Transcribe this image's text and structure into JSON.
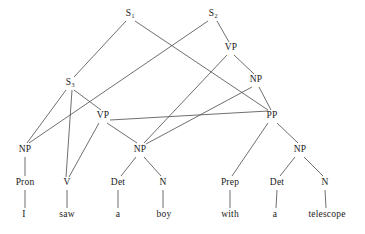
{
  "diagram": {
    "sentence": "I saw a boy with a telescope",
    "background_color": "#ffffff",
    "line_color": "#4a4a4a",
    "text_color": "#1a1a1a"
  },
  "nodes": [
    {
      "id": "S1",
      "label": "S",
      "subscript": "1",
      "kind": "category",
      "x": 130,
      "y": 14
    },
    {
      "id": "S2",
      "label": "S",
      "subscript": "2",
      "kind": "category",
      "x": 213,
      "y": 14
    },
    {
      "id": "VPhigh",
      "label": "VP",
      "subscript": "",
      "kind": "category",
      "x": 231,
      "y": 48
    },
    {
      "id": "S3",
      "label": "S",
      "subscript": "3",
      "kind": "category",
      "x": 70,
      "y": 83
    },
    {
      "id": "NPhigh",
      "label": "NP",
      "subscript": "",
      "kind": "category",
      "x": 256,
      "y": 80
    },
    {
      "id": "VPlow",
      "label": "VP",
      "subscript": "",
      "kind": "category",
      "x": 103,
      "y": 116
    },
    {
      "id": "PP",
      "label": "PP",
      "subscript": "",
      "kind": "category",
      "x": 272,
      "y": 116
    },
    {
      "id": "NPsubj",
      "label": "NP",
      "subscript": "",
      "kind": "category",
      "x": 25,
      "y": 150
    },
    {
      "id": "NPobj",
      "label": "NP",
      "subscript": "",
      "kind": "category",
      "x": 140,
      "y": 150
    },
    {
      "id": "NPpp",
      "label": "NP",
      "subscript": "",
      "kind": "category",
      "x": 300,
      "y": 150
    },
    {
      "id": "Pron",
      "label": "Pron",
      "subscript": "",
      "kind": "pos",
      "x": 25,
      "y": 183
    },
    {
      "id": "V",
      "label": "V",
      "subscript": "",
      "kind": "pos",
      "x": 67,
      "y": 183
    },
    {
      "id": "Det1",
      "label": "Det",
      "subscript": "",
      "kind": "pos",
      "x": 118,
      "y": 183
    },
    {
      "id": "N1",
      "label": "N",
      "subscript": "",
      "kind": "pos",
      "x": 163,
      "y": 183
    },
    {
      "id": "Prep",
      "label": "Prep",
      "subscript": "",
      "kind": "pos",
      "x": 230,
      "y": 183
    },
    {
      "id": "Det2",
      "label": "Det",
      "subscript": "",
      "kind": "pos",
      "x": 277,
      "y": 183
    },
    {
      "id": "N2",
      "label": "N",
      "subscript": "",
      "kind": "pos",
      "x": 325,
      "y": 183
    },
    {
      "id": "w_I",
      "label": "I",
      "subscript": "",
      "kind": "word",
      "x": 24,
      "y": 215
    },
    {
      "id": "w_saw",
      "label": "saw",
      "subscript": "",
      "kind": "word",
      "x": 67,
      "y": 215
    },
    {
      "id": "w_a1",
      "label": "a",
      "subscript": "",
      "kind": "word",
      "x": 118,
      "y": 215
    },
    {
      "id": "w_boy",
      "label": "boy",
      "subscript": "",
      "kind": "word",
      "x": 164,
      "y": 215
    },
    {
      "id": "w_with",
      "label": "with",
      "subscript": "",
      "kind": "word",
      "x": 230,
      "y": 215
    },
    {
      "id": "w_a2",
      "label": "a",
      "subscript": "",
      "kind": "word",
      "x": 275,
      "y": 215
    },
    {
      "id": "w_tel",
      "label": "telescope",
      "subscript": "",
      "kind": "word",
      "x": 327,
      "y": 215
    }
  ],
  "edges": [
    {
      "from": "S1",
      "to": "S3",
      "x1": 126,
      "y1": 21,
      "x2": 74,
      "y2": 77
    },
    {
      "from": "S1",
      "to": "PP",
      "x1": 135,
      "y1": 21,
      "x2": 268,
      "y2": 110
    },
    {
      "from": "S2",
      "to": "NPsubj",
      "x1": 208,
      "y1": 21,
      "x2": 29,
      "y2": 143
    },
    {
      "from": "S2",
      "to": "VPhigh",
      "x1": 217,
      "y1": 21,
      "x2": 229,
      "y2": 42
    },
    {
      "from": "VPhigh",
      "to": "NPobj",
      "x1": 227,
      "y1": 55,
      "x2": 144,
      "y2": 143
    },
    {
      "from": "VPhigh",
      "to": "NPhigh",
      "x1": 234,
      "y1": 55,
      "x2": 254,
      "y2": 74
    },
    {
      "from": "NPhigh",
      "to": "NPobj",
      "x1": 252,
      "y1": 87,
      "x2": 146,
      "y2": 144
    },
    {
      "from": "NPhigh",
      "to": "PP",
      "x1": 259,
      "y1": 87,
      "x2": 271,
      "y2": 110
    },
    {
      "from": "S3",
      "to": "NPsubj",
      "x1": 66,
      "y1": 90,
      "x2": 27,
      "y2": 143
    },
    {
      "from": "S3",
      "to": "VPlow",
      "x1": 74,
      "y1": 90,
      "x2": 101,
      "y2": 110
    },
    {
      "from": "VPlow",
      "to": "V",
      "x1": 99,
      "y1": 123,
      "x2": 69,
      "y2": 177
    },
    {
      "from": "VPlow",
      "to": "NPobj",
      "x1": 107,
      "y1": 123,
      "x2": 137,
      "y2": 143
    },
    {
      "from": "VPlow",
      "to": "PP",
      "x1": 110,
      "y1": 120,
      "x2": 268,
      "y2": 111
    },
    {
      "from": "S3",
      "to": "V",
      "x1": 72,
      "y1": 90,
      "x2": 66,
      "y2": 177
    },
    {
      "from": "NPsubj",
      "to": "Pron",
      "x1": 25,
      "y1": 157,
      "x2": 25,
      "y2": 176
    },
    {
      "from": "NPobj",
      "to": "Det1",
      "x1": 136,
      "y1": 157,
      "x2": 121,
      "y2": 176
    },
    {
      "from": "NPobj",
      "to": "N1",
      "x1": 144,
      "y1": 157,
      "x2": 161,
      "y2": 176
    },
    {
      "from": "PP",
      "to": "Prep",
      "x1": 268,
      "y1": 123,
      "x2": 232,
      "y2": 176
    },
    {
      "from": "PP",
      "to": "NPpp",
      "x1": 277,
      "y1": 123,
      "x2": 298,
      "y2": 143
    },
    {
      "from": "NPpp",
      "to": "Det2",
      "x1": 295,
      "y1": 157,
      "x2": 280,
      "y2": 176
    },
    {
      "from": "NPpp",
      "to": "N2",
      "x1": 304,
      "y1": 157,
      "x2": 323,
      "y2": 176
    },
    {
      "from": "Pron",
      "to": "w_I",
      "x1": 25,
      "y1": 190,
      "x2": 25,
      "y2": 208
    },
    {
      "from": "V",
      "to": "w_saw",
      "x1": 67,
      "y1": 190,
      "x2": 67,
      "y2": 208
    },
    {
      "from": "Det1",
      "to": "w_a1",
      "x1": 118,
      "y1": 190,
      "x2": 118,
      "y2": 208
    },
    {
      "from": "N1",
      "to": "w_boy",
      "x1": 163,
      "y1": 190,
      "x2": 163,
      "y2": 208
    },
    {
      "from": "Prep",
      "to": "w_with",
      "x1": 230,
      "y1": 190,
      "x2": 230,
      "y2": 208
    },
    {
      "from": "Det2",
      "to": "w_a2",
      "x1": 277,
      "y1": 190,
      "x2": 276,
      "y2": 208
    },
    {
      "from": "N2",
      "to": "w_tel",
      "x1": 325,
      "y1": 190,
      "x2": 326,
      "y2": 208
    }
  ]
}
